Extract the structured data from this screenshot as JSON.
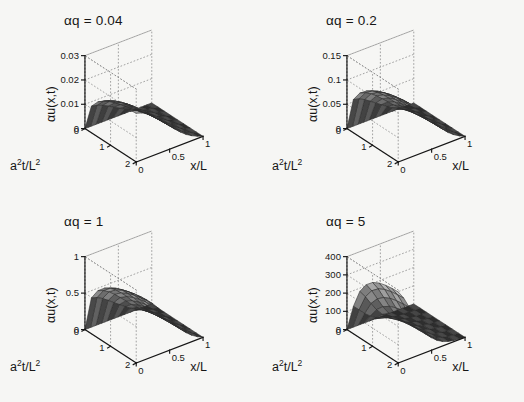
{
  "figure": {
    "background": "#f6f6f4",
    "ink": "#161616",
    "panel_count": 4
  },
  "chart_data": {
    "type": "surface",
    "title": "",
    "xlabel": "x/L",
    "ylabel": "a²t/L²",
    "zlabel": "αu(x,t)",
    "xlim": [
      0,
      1
    ],
    "ylim": [
      0,
      2
    ],
    "xticks": [
      "0",
      "0.5",
      "1"
    ],
    "xtickvals": [
      0,
      0.5,
      1
    ],
    "yticks": [
      "0",
      "1",
      "2"
    ],
    "ytickvals": [
      0,
      1,
      2
    ],
    "grid": true,
    "grid_style": "dotted",
    "view": {
      "azimuth": -37.5,
      "elevation": 30
    },
    "mesh": {
      "nx": 13,
      "ny": 9,
      "colormap": "gray",
      "edge_color": "#2b2b2b"
    },
    "panels": [
      {
        "title": "αq = 0.04",
        "aq": 0.04,
        "zlim": [
          0,
          0.03
        ],
        "zticks": [
          "0",
          "0.01",
          "0.02",
          "0.03"
        ],
        "ztickvals": [
          0,
          0.01,
          0.02,
          0.03
        ],
        "zmax_surface": 0.02,
        "x": [
          0,
          0.0833,
          0.1667,
          0.25,
          0.3333,
          0.4167,
          0.5,
          0.5833,
          0.6667,
          0.75,
          0.8333,
          0.9167,
          1
        ],
        "t": [
          0,
          0.25,
          0.5,
          0.75,
          1,
          1.25,
          1.5,
          1.75,
          2
        ],
        "z": [
          [
            0.0,
            0.0,
            0.0,
            0.0,
            0.0,
            0.0,
            0.0,
            0.0,
            0.0,
            0.0,
            0.0,
            0.0,
            0.0
          ],
          [
            0.0109,
            0.0104,
            0.0095,
            0.0083,
            0.007,
            0.0057,
            0.0044,
            0.0033,
            0.0023,
            0.0015,
            0.0009,
            0.0004,
            0.0
          ],
          [
            0.0144,
            0.0138,
            0.0128,
            0.0114,
            0.0098,
            0.0081,
            0.0064,
            0.0048,
            0.0034,
            0.0022,
            0.0013,
            0.0006,
            0.0
          ],
          [
            0.0165,
            0.0158,
            0.0147,
            0.0132,
            0.0114,
            0.0095,
            0.0076,
            0.0057,
            0.0041,
            0.0026,
            0.0015,
            0.0007,
            0.0
          ],
          [
            0.0178,
            0.0171,
            0.0159,
            0.0143,
            0.0124,
            0.0104,
            0.0083,
            0.0063,
            0.0045,
            0.0029,
            0.0017,
            0.0007,
            0.0
          ],
          [
            0.0187,
            0.018,
            0.0168,
            0.0151,
            0.0131,
            0.011,
            0.0088,
            0.0067,
            0.0048,
            0.0031,
            0.0018,
            0.0008,
            0.0
          ],
          [
            0.0193,
            0.0186,
            0.0173,
            0.0156,
            0.0136,
            0.0114,
            0.0092,
            0.007,
            0.005,
            0.0033,
            0.0019,
            0.0008,
            0.0
          ],
          [
            0.0197,
            0.019,
            0.0177,
            0.016,
            0.0139,
            0.0117,
            0.0094,
            0.0072,
            0.0051,
            0.0034,
            0.0019,
            0.0008,
            0.0
          ],
          [
            0.02,
            0.0193,
            0.018,
            0.0162,
            0.0141,
            0.0119,
            0.0096,
            0.0073,
            0.0052,
            0.0034,
            0.002,
            0.0009,
            0.0
          ]
        ]
      },
      {
        "title": "αq = 0.2",
        "aq": 0.2,
        "zlim": [
          0,
          0.15
        ],
        "zticks": [
          "0",
          "0.05",
          "0.1",
          "0.15"
        ],
        "ztickvals": [
          0,
          0.05,
          0.1,
          0.15
        ],
        "zmax_surface": 0.125,
        "x": [
          0,
          0.0833,
          0.1667,
          0.25,
          0.3333,
          0.4167,
          0.5,
          0.5833,
          0.6667,
          0.75,
          0.8333,
          0.9167,
          1
        ],
        "t": [
          0,
          0.25,
          0.5,
          0.75,
          1,
          1.25,
          1.5,
          1.75,
          2
        ],
        "z": [
          [
            0.0,
            0.0,
            0.0,
            0.0,
            0.0,
            0.0,
            0.0,
            0.0,
            0.0,
            0.0,
            0.0,
            0.0,
            0.0
          ],
          [
            0.0683,
            0.0652,
            0.0594,
            0.0517,
            0.0436,
            0.0356,
            0.0277,
            0.0206,
            0.0145,
            0.0094,
            0.0055,
            0.0024,
            0.0
          ],
          [
            0.0901,
            0.0862,
            0.0799,
            0.0712,
            0.061,
            0.0504,
            0.0398,
            0.0299,
            0.0211,
            0.0136,
            0.0079,
            0.0035,
            0.0
          ],
          [
            0.103,
            0.0988,
            0.0917,
            0.0822,
            0.0711,
            0.0591,
            0.0471,
            0.0356,
            0.0253,
            0.0163,
            0.0094,
            0.0041,
            0.0
          ],
          [
            0.1112,
            0.1066,
            0.0992,
            0.0893,
            0.0774,
            0.0646,
            0.0517,
            0.0392,
            0.0279,
            0.0181,
            0.0104,
            0.0045,
            0.0
          ],
          [
            0.1166,
            0.1119,
            0.1043,
            0.094,
            0.0817,
            0.0684,
            0.0548,
            0.0417,
            0.0297,
            0.0192,
            0.0111,
            0.0048,
            0.0
          ],
          [
            0.1203,
            0.1155,
            0.1077,
            0.0972,
            0.0847,
            0.071,
            0.057,
            0.0434,
            0.031,
            0.0201,
            0.0116,
            0.005,
            0.0
          ],
          [
            0.1229,
            0.118,
            0.1101,
            0.0994,
            0.0867,
            0.0728,
            0.0585,
            0.0446,
            0.0318,
            0.0206,
            0.0119,
            0.0052,
            0.0
          ],
          [
            0.1247,
            0.1197,
            0.1117,
            0.1009,
            0.0881,
            0.074,
            0.0595,
            0.0454,
            0.0324,
            0.021,
            0.0121,
            0.0053,
            0.0
          ]
        ]
      },
      {
        "title": "αq = 1",
        "aq": 1,
        "zlim": [
          0,
          1
        ],
        "zticks": [
          "0",
          "0.5",
          "1"
        ],
        "ztickvals": [
          0,
          0.5,
          1
        ],
        "zmax_surface": 0.9,
        "x": [
          0,
          0.0833,
          0.1667,
          0.25,
          0.3333,
          0.4167,
          0.5,
          0.5833,
          0.6667,
          0.75,
          0.8333,
          0.9167,
          1
        ],
        "t": [
          0,
          0.25,
          0.5,
          0.75,
          1,
          1.25,
          1.5,
          1.75,
          2
        ],
        "z": [
          [
            0.0,
            0.0,
            0.0,
            0.0,
            0.0,
            0.0,
            0.0,
            0.0,
            0.0,
            0.0,
            0.0,
            0.0,
            0.0
          ],
          [
            0.49,
            0.467,
            0.425,
            0.37,
            0.311,
            0.254,
            0.198,
            0.147,
            0.103,
            0.067,
            0.039,
            0.017,
            0.0
          ],
          [
            0.647,
            0.619,
            0.573,
            0.51,
            0.437,
            0.361,
            0.285,
            0.214,
            0.151,
            0.097,
            0.056,
            0.025,
            0.0
          ],
          [
            0.739,
            0.709,
            0.658,
            0.589,
            0.509,
            0.423,
            0.337,
            0.255,
            0.181,
            0.117,
            0.067,
            0.029,
            0.0
          ],
          [
            0.798,
            0.765,
            0.712,
            0.64,
            0.555,
            0.463,
            0.37,
            0.281,
            0.2,
            0.129,
            0.074,
            0.032,
            0.0
          ],
          [
            0.836,
            0.802,
            0.748,
            0.674,
            0.586,
            0.49,
            0.393,
            0.299,
            0.213,
            0.138,
            0.079,
            0.034,
            0.0
          ],
          [
            0.863,
            0.828,
            0.773,
            0.697,
            0.607,
            0.509,
            0.408,
            0.311,
            0.222,
            0.144,
            0.083,
            0.036,
            0.0
          ],
          [
            0.881,
            0.846,
            0.79,
            0.713,
            0.622,
            0.522,
            0.419,
            0.32,
            0.228,
            0.148,
            0.085,
            0.037,
            0.0
          ],
          [
            0.894,
            0.858,
            0.801,
            0.724,
            0.632,
            0.531,
            0.427,
            0.326,
            0.233,
            0.151,
            0.087,
            0.038,
            0.0
          ]
        ]
      },
      {
        "title": "αq = 5",
        "aq": 5,
        "zlim": [
          0,
          400
        ],
        "zticks": [
          "0",
          "100",
          "200",
          "300",
          "400"
        ],
        "ztickvals": [
          0,
          100,
          200,
          300,
          400
        ],
        "zmax_surface": 390,
        "x": [
          0,
          0.0833,
          0.1667,
          0.25,
          0.3333,
          0.4167,
          0.5,
          0.5833,
          0.6667,
          0.75,
          0.8333,
          0.9167,
          1
        ],
        "t": [
          0,
          0.25,
          0.5,
          0.75,
          1,
          1.25,
          1.5,
          1.75,
          2
        ],
        "z": [
          [
            0.0,
            0.0,
            0.0,
            0.0,
            0.0,
            0.0,
            0.0,
            0.0,
            0.0,
            0.0,
            0.0,
            0.0,
            0.0
          ],
          [
            150.0,
            120.0,
            88.0,
            62.0,
            42.0,
            28.0,
            18.0,
            11.0,
            6.5,
            3.5,
            1.7,
            0.6,
            0.0
          ],
          [
            255.0,
            214.0,
            165.0,
            120.0,
            83.0,
            55.0,
            35.0,
            21.0,
            12.0,
            6.4,
            3.0,
            1.1,
            0.0
          ],
          [
            315.0,
            270.0,
            214.0,
            159.0,
            112.0,
            75.0,
            48.0,
            29.0,
            16.5,
            8.8,
            4.1,
            1.5,
            0.0
          ],
          [
            350.0,
            303.0,
            244.0,
            184.0,
            131.0,
            88.0,
            57.0,
            34.0,
            19.6,
            10.4,
            4.9,
            1.8,
            0.0
          ],
          [
            370.0,
            323.0,
            262.0,
            199.0,
            142.0,
            96.0,
            62.0,
            38.0,
            21.5,
            11.4,
            5.4,
            2.0,
            0.0
          ],
          [
            381.0,
            334.0,
            272.0,
            208.0,
            149.0,
            101.0,
            65.0,
            40.0,
            22.7,
            12.1,
            5.7,
            2.1,
            0.0
          ],
          [
            387.0,
            340.0,
            278.0,
            213.0,
            153.0,
            104.0,
            67.0,
            41.0,
            23.4,
            12.4,
            5.8,
            2.1,
            0.0
          ],
          [
            390.0,
            344.0,
            281.0,
            216.0,
            155.0,
            105.0,
            68.0,
            42.0,
            23.8,
            12.6,
            5.9,
            2.2,
            0.0
          ]
        ]
      }
    ]
  }
}
